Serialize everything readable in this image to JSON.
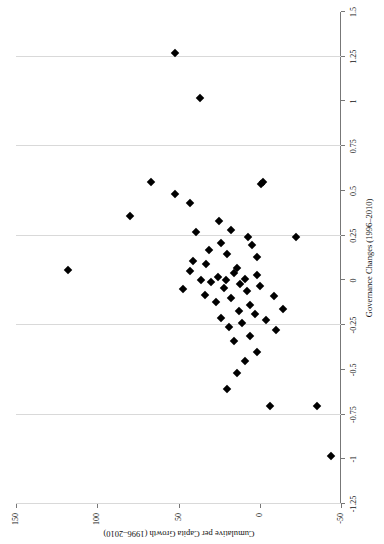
{
  "chart_data": {
    "type": "scatter",
    "title": "",
    "xlabel": "Governance Changes (1996–2010)",
    "ylabel": "Cumulative per Capita Growth (1996–2010)",
    "xlim": [
      -1.25,
      1.5
    ],
    "ylim": [
      -50,
      150
    ],
    "xticks": [
      -1.25,
      -1,
      -0.75,
      -0.5,
      -0.25,
      0,
      0.25,
      0.5,
      0.75,
      1,
      1.25,
      1.5
    ],
    "xticklabels": [
      "-1.25",
      "-1",
      "-0.75",
      "-0.5",
      "-0.25",
      "0",
      "0.25",
      "0.5",
      "0.75",
      "1",
      "1.25",
      "1.5"
    ],
    "yticks": [
      -50,
      0,
      50,
      100,
      150
    ],
    "yticklabels": [
      "-50",
      "0",
      "50",
      "100",
      "150"
    ],
    "gridlines": {
      "vertical_at": [
        -1.25,
        -0.75,
        -0.25,
        0.25,
        0.75,
        1.25
      ],
      "horizontal": false
    },
    "marker": "diamond",
    "marker_color": "#000000",
    "points": [
      {
        "x": 1.27,
        "y": 52
      },
      {
        "x": 1.02,
        "y": 37
      },
      {
        "x": 0.55,
        "y": 67
      },
      {
        "x": 0.48,
        "y": 52
      },
      {
        "x": 0.43,
        "y": 43
      },
      {
        "x": 0.36,
        "y": 80
      },
      {
        "x": 0.55,
        "y": -2
      },
      {
        "x": 0.54,
        "y": -1
      },
      {
        "x": 0.33,
        "y": 25
      },
      {
        "x": 0.28,
        "y": 18
      },
      {
        "x": 0.27,
        "y": 39
      },
      {
        "x": 0.24,
        "y": 7
      },
      {
        "x": 0.24,
        "y": -22
      },
      {
        "x": 0.21,
        "y": 24
      },
      {
        "x": 0.2,
        "y": 5
      },
      {
        "x": 0.17,
        "y": 31
      },
      {
        "x": 0.15,
        "y": 20
      },
      {
        "x": 0.13,
        "y": 2
      },
      {
        "x": 0.11,
        "y": 41
      },
      {
        "x": 0.09,
        "y": 33
      },
      {
        "x": 0.07,
        "y": 14
      },
      {
        "x": 0.06,
        "y": 118
      },
      {
        "x": 0.05,
        "y": 43
      },
      {
        "x": 0.04,
        "y": 16
      },
      {
        "x": 0.03,
        "y": 2
      },
      {
        "x": 0.02,
        "y": 26
      },
      {
        "x": 0.01,
        "y": 9
      },
      {
        "x": 0.0,
        "y": 36
      },
      {
        "x": 0.0,
        "y": 21
      },
      {
        "x": -0.01,
        "y": 30
      },
      {
        "x": -0.02,
        "y": 12
      },
      {
        "x": -0.03,
        "y": 0
      },
      {
        "x": -0.04,
        "y": 22
      },
      {
        "x": -0.05,
        "y": 47
      },
      {
        "x": -0.06,
        "y": 8
      },
      {
        "x": -0.08,
        "y": 34
      },
      {
        "x": -0.09,
        "y": -9
      },
      {
        "x": -0.1,
        "y": 18
      },
      {
        "x": -0.12,
        "y": 27
      },
      {
        "x": -0.14,
        "y": 6
      },
      {
        "x": -0.16,
        "y": -14
      },
      {
        "x": -0.17,
        "y": 13
      },
      {
        "x": -0.19,
        "y": 3
      },
      {
        "x": -0.21,
        "y": 24
      },
      {
        "x": -0.22,
        "y": -4
      },
      {
        "x": -0.24,
        "y": 11
      },
      {
        "x": -0.26,
        "y": 19
      },
      {
        "x": -0.28,
        "y": -10
      },
      {
        "x": -0.31,
        "y": 6
      },
      {
        "x": -0.34,
        "y": 16
      },
      {
        "x": -0.4,
        "y": 2
      },
      {
        "x": -0.45,
        "y": 9
      },
      {
        "x": -0.52,
        "y": 14
      },
      {
        "x": -0.61,
        "y": 20
      },
      {
        "x": -0.7,
        "y": -6
      },
      {
        "x": -0.7,
        "y": -35
      },
      {
        "x": -0.98,
        "y": -44
      }
    ]
  },
  "page": {
    "axis_color": "#777777",
    "grid_color": "#d9d9d9",
    "background": "#ffffff"
  }
}
